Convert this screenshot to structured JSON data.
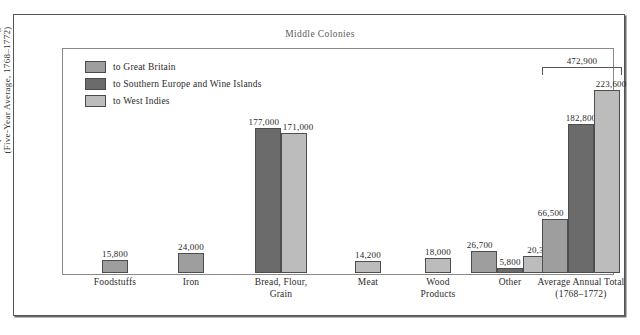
{
  "figure": {
    "title": "Middle Colonies",
    "y_axis_title_line1": "Export Value in Pounds Sterling",
    "y_axis_title_line2": "(Five-Year Average, 1768–1772)"
  },
  "legend": {
    "items": [
      {
        "label": "to Great Britain",
        "color": "#9e9e9e",
        "key": "great_britain"
      },
      {
        "label": "to Southern Europe and Wine Islands",
        "color": "#6b6b6b",
        "key": "southern_europe"
      },
      {
        "label": "to West Indies",
        "color": "#bcbcbc",
        "key": "west_indies"
      }
    ]
  },
  "chart_data": {
    "type": "bar",
    "title": "Middle Colonies",
    "xlabel": "",
    "ylabel": "Export Value in Pounds Sterling (Five-Year Average, 1768–1772)",
    "ylim": [
      0,
      240000
    ],
    "grid": false,
    "legend_position": "top-left",
    "categories": [
      "Foodstuffs",
      "Iron",
      "Bread, Flour, Grain",
      "Meat",
      "Wood Products",
      "Other",
      "Average Annual Total (1768–1772)"
    ],
    "series": [
      {
        "name": "to Great Britain",
        "color": "#9e9e9e",
        "values": [
          15800,
          24000,
          null,
          null,
          null,
          26700,
          66500
        ]
      },
      {
        "name": "to Southern Europe and Wine Islands",
        "color": "#6b6b6b",
        "values": [
          null,
          null,
          177000,
          null,
          null,
          5800,
          182800
        ]
      },
      {
        "name": "to West Indies",
        "color": "#bcbcbc",
        "values": [
          null,
          null,
          171000,
          14200,
          18000,
          20300,
          223600
        ]
      }
    ],
    "annotations": [
      {
        "text": "472,900",
        "describes": "Average Annual Total (1768–1772) sum",
        "value": 472900
      }
    ]
  },
  "groups": [
    {
      "name": "Foodstuffs",
      "label_line1": "Foodstuffs",
      "label_line2": "",
      "bars": [
        {
          "series": "to Great Britain",
          "value": 15800,
          "value_label": "15,800",
          "color": "#9e9e9e"
        }
      ]
    },
    {
      "name": "Iron",
      "label_line1": "Iron",
      "label_line2": "",
      "bars": [
        {
          "series": "to Great Britain",
          "value": 24000,
          "value_label": "24,000",
          "color": "#9e9e9e"
        }
      ]
    },
    {
      "name": "Bread, Flour, Grain",
      "label_line1": "Bread, Flour,",
      "label_line2": "Grain",
      "bars": [
        {
          "series": "to Southern Europe and Wine Islands",
          "value": 177000,
          "value_label": "177,000",
          "color": "#6b6b6b"
        },
        {
          "series": "to West Indies",
          "value": 171000,
          "value_label": "171,000",
          "color": "#bcbcbc"
        }
      ]
    },
    {
      "name": "Meat",
      "label_line1": "Meat",
      "label_line2": "",
      "bars": [
        {
          "series": "to West Indies",
          "value": 14200,
          "value_label": "14,200",
          "color": "#bcbcbc"
        }
      ]
    },
    {
      "name": "Wood Products",
      "label_line1": "Wood",
      "label_line2": "Products",
      "bars": [
        {
          "series": "to West Indies",
          "value": 18000,
          "value_label": "18,000",
          "color": "#bcbcbc"
        }
      ]
    },
    {
      "name": "Other",
      "label_line1": "Other",
      "label_line2": "",
      "bars": [
        {
          "series": "to Great Britain",
          "value": 26700,
          "value_label": "26,700",
          "color": "#9e9e9e"
        },
        {
          "series": "to Southern Europe and Wine Islands",
          "value": 5800,
          "value_label": "5,800",
          "color": "#6b6b6b"
        },
        {
          "series": "to West Indies",
          "value": 20300,
          "value_label": "20,300",
          "color": "#bcbcbc"
        }
      ]
    },
    {
      "name": "Average Annual Total",
      "label_line1": "Average Annual Total",
      "label_line2": "(1768–1772)",
      "bracket_value_label": "472,900",
      "bars": [
        {
          "series": "to Great Britain",
          "value": 66500,
          "value_label": "66,500",
          "color": "#9e9e9e"
        },
        {
          "series": "to Southern Europe and Wine Islands",
          "value": 182800,
          "value_label": "182,800",
          "color": "#6b6b6b"
        },
        {
          "series": "to West Indies",
          "value": 223600,
          "value_label": "223,600",
          "color": "#bcbcbc"
        }
      ]
    }
  ]
}
